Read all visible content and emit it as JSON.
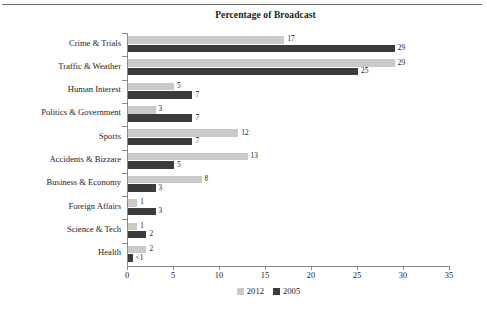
{
  "chart_data": {
    "type": "bar",
    "orientation": "horizontal",
    "title": "Percentage of Broadcast",
    "xlabel": "",
    "ylabel": "",
    "xlim": [
      0,
      35
    ],
    "xticks": [
      0,
      5,
      10,
      15,
      20,
      25,
      30,
      35
    ],
    "grid": false,
    "legend_position": "bottom-center",
    "categories": [
      "Crime & Trials",
      "Traffic & Weather",
      "Human Interest",
      "Politics & Government",
      "Sports",
      "Accidents & Bizzare",
      "Business & Economy",
      "Foreign Affairs",
      "Science & Tech",
      "Health"
    ],
    "series": [
      {
        "name": "2012",
        "color": "#c9c9c9",
        "values": [
          17,
          29,
          5,
          3,
          12,
          13,
          8,
          1,
          1,
          2
        ],
        "labels": [
          "17",
          "29",
          "5",
          "3",
          "12",
          "13",
          "8",
          "1",
          "1",
          "2"
        ]
      },
      {
        "name": "2005",
        "color": "#3b3b3b",
        "values": [
          29,
          25,
          7,
          7,
          7,
          5,
          3,
          3,
          2,
          0.5
        ],
        "labels": [
          "29",
          "25",
          "7",
          "7",
          "7",
          "5",
          "3",
          "3",
          "2",
          "<1"
        ]
      }
    ]
  },
  "legend": {
    "items": [
      {
        "label": "2012",
        "color": "#c9c9c9"
      },
      {
        "label": "2005",
        "color": "#3b3b3b"
      }
    ]
  }
}
